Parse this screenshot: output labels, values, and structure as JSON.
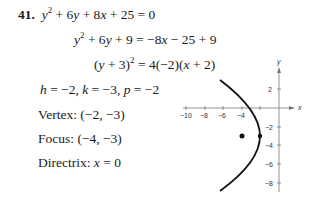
{
  "problem": {
    "number": "41.",
    "equations": [
      {
        "lhs": "y² + 6y + 8x + 25",
        "rhs": "0"
      },
      {
        "lhs": "y² + 6y + 9",
        "rhs": "−8x − 25 + 9"
      },
      {
        "lhs": "(y + 3)²",
        "rhs": "4(−2)(x + 2)"
      }
    ],
    "params": "h = −2, k = −3, p = −2",
    "vertex_label": "Vertex:",
    "vertex_value": "(−2, −3)",
    "focus_label": "Focus:",
    "focus_value": "(−4, −3)",
    "directrix_label": "Directrix:",
    "directrix_value": "x = 0"
  },
  "graph": {
    "x_axis_label": "x",
    "y_axis_label": "y",
    "x_ticks": [
      "−10",
      "−8",
      "−6",
      "−4"
    ],
    "y_ticks": [
      "2",
      "−2",
      "−4",
      "−6",
      "−8"
    ],
    "vertex": [
      -2,
      -3
    ],
    "focus": [
      -4,
      -3
    ],
    "curve": "(y + 3)² = −8(x + 2)"
  }
}
